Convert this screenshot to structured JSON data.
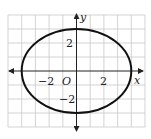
{
  "figure": {
    "type": "ellipse-graph",
    "axes": {
      "x_label": "x",
      "y_label": "y",
      "origin_label": "O",
      "x_ticks": [
        {
          "value": -2,
          "label": "−2"
        },
        {
          "value": 2,
          "label": "2"
        }
      ],
      "y_ticks": [
        {
          "value": 2,
          "label": "2"
        },
        {
          "value": -2,
          "label": "−2"
        }
      ],
      "x_range": [
        -5,
        5
      ],
      "y_range": [
        -4,
        4
      ],
      "grid": true
    },
    "curve": {
      "shape": "ellipse",
      "center": [
        0,
        0
      ],
      "semi_major_x": 4,
      "semi_minor_y": 3
    },
    "colors": {
      "grid": "#c8c8c8",
      "axis": "#222222",
      "curve": "#111111",
      "background": "#ffffff"
    }
  }
}
